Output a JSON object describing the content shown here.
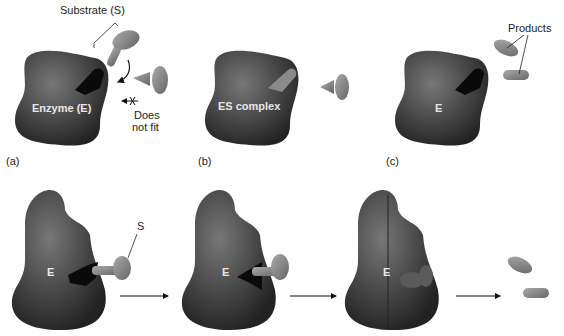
{
  "panels": {
    "a": {
      "tag": "(a)",
      "enzyme_label": "Enzyme (E)",
      "substrate_label": "Substrate (S)",
      "nofit_line1": "Does",
      "nofit_line2": "not fit"
    },
    "b": {
      "tag": "(b)",
      "complex_label": "ES complex"
    },
    "c": {
      "tag": "(c)",
      "enzyme_label": "E",
      "products_label": "Products"
    }
  },
  "induced_fit": {
    "step1": {
      "enzyme_label": "E",
      "substrate_label": "S"
    },
    "step2": {
      "enzyme_label": "E"
    },
    "step3": {
      "enzyme_label": "E"
    }
  },
  "colors": {
    "enzyme": "#3e3e3e",
    "pocket": "#0a0a0a",
    "substrate": "#8a8a8a",
    "background": "#ffffff"
  }
}
